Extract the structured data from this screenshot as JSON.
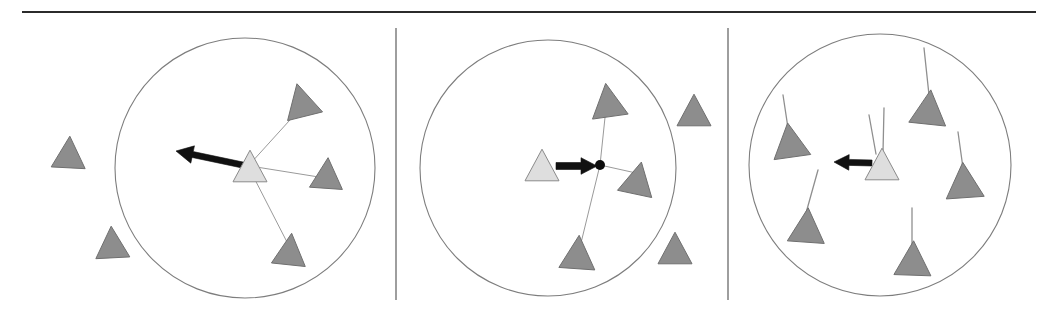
{
  "figure": {
    "width": 1057,
    "height": 332,
    "background_color": "#ffffff",
    "caption": "",
    "colors": {
      "agent_fill": "#8d8d8d",
      "agent_stroke": "#6f6f6f",
      "focal_agent_fill": "#dedede",
      "focal_agent_stroke": "#8a8a8a",
      "neighbor_link": "#9a9a9a",
      "circle_stroke": "#7d7d7d",
      "arrow": "#111111",
      "divider": "#6a6a6a",
      "top_rule": "#2b2b2b"
    }
  },
  "top_rule": {
    "label": "horizontal-rule",
    "x1": 22,
    "y1": 12,
    "x2": 1036,
    "y2": 12
  },
  "dividers": [
    {
      "label": "panel-divider-1",
      "x": 396,
      "y1": 28,
      "y2": 300
    },
    {
      "label": "panel-divider-2",
      "x": 728,
      "y1": 28,
      "y2": 300
    }
  ],
  "panels": [
    {
      "id": "panel-1",
      "name": "attraction-to-neighbors",
      "circle": {
        "cx": 245,
        "cy": 168,
        "r": 130
      },
      "focal_agent": {
        "cx": 250,
        "cy": 166,
        "size": 34,
        "rotation": 0,
        "fill": "light"
      },
      "neighbors_inside": [
        {
          "cx": 301,
          "cy": 100,
          "size": 36,
          "rotation": -14
        },
        {
          "cx": 327,
          "cy": 173,
          "size": 33,
          "rotation": 4
        },
        {
          "cx": 290,
          "cy": 249,
          "size": 34,
          "rotation": 6
        }
      ],
      "agents_outside": [
        {
          "cx": 69,
          "cy": 152,
          "size": 34,
          "rotation": 3
        },
        {
          "cx": 112,
          "cy": 242,
          "size": 34,
          "rotation": -3
        }
      ],
      "links": [
        {
          "from": [
            250,
            164
          ],
          "to": [
            299,
            110
          ]
        },
        {
          "from": [
            250,
            166
          ],
          "to": [
            325,
            178
          ]
        },
        {
          "from": [
            250,
            170
          ],
          "to": [
            288,
            244
          ]
        }
      ],
      "vector": {
        "from": [
          252,
          167
        ],
        "to": [
          176,
          151
        ],
        "head_size": 17,
        "shaft_width": 6
      },
      "centroid_dot": null
    },
    {
      "id": "panel-2",
      "name": "move-toward-local-centroid",
      "circle": {
        "cx": 548,
        "cy": 168,
        "r": 128
      },
      "focal_agent": {
        "cx": 542,
        "cy": 165,
        "size": 34,
        "rotation": 0,
        "fill": "light"
      },
      "neighbors_inside": [
        {
          "cx": 608,
          "cy": 100,
          "size": 36,
          "rotation": -8
        },
        {
          "cx": 638,
          "cy": 178,
          "size": 35,
          "rotation": 12
        },
        {
          "cx": 578,
          "cy": 252,
          "size": 36,
          "rotation": 4
        }
      ],
      "agents_outside": [
        {
          "cx": 694,
          "cy": 110,
          "size": 34,
          "rotation": 0
        },
        {
          "cx": 675,
          "cy": 248,
          "size": 34,
          "rotation": 0
        }
      ],
      "links": [
        {
          "from": [
            600,
            165
          ],
          "to": [
            606,
            108
          ]
        },
        {
          "from": [
            600,
            165
          ],
          "to": [
            636,
            173
          ]
        },
        {
          "from": [
            600,
            165
          ],
          "to": [
            580,
            247
          ]
        }
      ],
      "vector": {
        "from": [
          556,
          166
        ],
        "to": [
          597,
          166
        ],
        "head_size": 16,
        "shaft_width": 7
      },
      "centroid_dot": {
        "cx": 600,
        "cy": 165,
        "r": 5
      }
    },
    {
      "id": "panel-3",
      "name": "align-with-neighbor-headings",
      "circle": {
        "cx": 880,
        "cy": 165,
        "r": 131
      },
      "focal_agent": {
        "cx": 882,
        "cy": 164,
        "size": 34,
        "rotation": 0,
        "fill": "light"
      },
      "neighbors_inside": [
        {
          "cx": 790,
          "cy": 140,
          "size": 37,
          "rotation": -8
        },
        {
          "cx": 929,
          "cy": 107,
          "size": 37,
          "rotation": 6
        },
        {
          "cx": 964,
          "cy": 180,
          "size": 38,
          "rotation": -4
        },
        {
          "cx": 807,
          "cy": 225,
          "size": 37,
          "rotation": 4
        },
        {
          "cx": 913,
          "cy": 258,
          "size": 37,
          "rotation": 2
        }
      ],
      "agents_outside": [],
      "heading_whiskers": [
        {
          "from": [
            883,
            152
          ],
          "to": [
            884,
            108
          ]
        },
        {
          "from": [
            876,
            154
          ],
          "to": [
            869,
            115
          ]
        },
        {
          "from": [
            788,
            128
          ],
          "to": [
            783,
            95
          ]
        },
        {
          "from": [
            929,
            95
          ],
          "to": [
            924,
            48
          ]
        },
        {
          "from": [
            963,
            168
          ],
          "to": [
            958,
            132
          ]
        },
        {
          "from": [
            806,
            213
          ],
          "to": [
            818,
            170
          ]
        },
        {
          "from": [
            912,
            246
          ],
          "to": [
            912,
            208
          ]
        }
      ],
      "vector": {
        "from": [
          872,
          163
        ],
        "to": [
          834,
          162
        ],
        "head_size": 15,
        "shaft_width": 6
      },
      "centroid_dot": null
    }
  ]
}
